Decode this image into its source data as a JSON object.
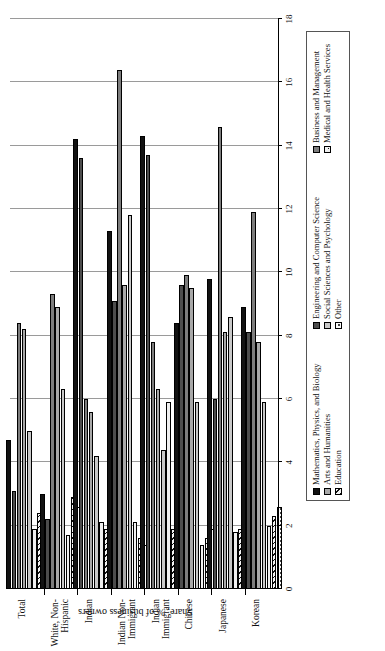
{
  "chart_data": {
    "type": "bar",
    "orientation": "horizontal",
    "title": "",
    "xlabel": "",
    "ylabel": "Share, % of business owners",
    "ylim": [
      0,
      18
    ],
    "ytick_step": 2,
    "yticks": [
      0,
      2,
      4,
      6,
      8,
      10,
      12,
      14,
      16,
      18
    ],
    "grid": true,
    "legend_position": "bottom",
    "categories": [
      "Total",
      "White, Non-Hispanic",
      "Indian",
      "Indian Non-Immigrant",
      "Indian Immigrant",
      "Chinese",
      "Japanese",
      "Korean"
    ],
    "series": [
      {
        "name": "Mathematics, Physics, and Biology",
        "values": [
          4.7,
          3.0,
          14.2,
          11.3,
          14.3,
          8.4,
          9.8,
          8.9
        ]
      },
      {
        "name": "Engineering and Computer Science",
        "values": [
          3.1,
          2.2,
          13.6,
          9.1,
          13.7,
          9.6,
          6.0,
          8.1
        ]
      },
      {
        "name": "Business and Management",
        "values": [
          8.4,
          9.3,
          6.0,
          16.4,
          7.8,
          9.9,
          14.6,
          11.9
        ]
      },
      {
        "name": "Arts and Humanities",
        "values": [
          8.2,
          8.9,
          5.6,
          9.6,
          6.3,
          9.5,
          8.1,
          7.8
        ]
      },
      {
        "name": "Social Sciences and Psychology",
        "values": [
          5.0,
          6.3,
          4.2,
          11.8,
          4.4,
          5.9,
          8.6,
          5.9
        ]
      },
      {
        "name": "Medical and Health Services",
        "values": [
          1.9,
          1.7,
          2.1,
          2.1,
          5.9,
          1.4,
          1.8,
          2.0
        ]
      },
      {
        "name": "Education",
        "values": [
          2.4,
          2.9,
          1.9,
          1.6,
          1.9,
          1.6,
          1.9,
          2.3
        ]
      },
      {
        "name": "Other",
        "values": [
          2.1,
          2.6,
          1.5,
          1.4,
          2.0,
          1.9,
          2.5,
          2.6
        ]
      }
    ]
  },
  "axis": {
    "value_axis_title": "Share, % of business owners",
    "tick_labels": [
      "0",
      "2",
      "4",
      "6",
      "8",
      "10",
      "12",
      "14",
      "16",
      "18"
    ]
  },
  "legend": {
    "items": [
      {
        "label": "Mathematics, Physics, and Biology",
        "swatch": "solid-black"
      },
      {
        "label": "Engineering and Computer Science",
        "swatch": "solid-dark-gray"
      },
      {
        "label": "Business and Management",
        "swatch": "solid-medium-gray"
      },
      {
        "label": "Arts and Humanities",
        "swatch": "solid-light-gray"
      },
      {
        "label": "Social Sciences and Psychology",
        "swatch": "solid-pale-gray"
      },
      {
        "label": "Medical and Health Services",
        "swatch": "dotted"
      },
      {
        "label": "Education",
        "swatch": "hatched"
      },
      {
        "label": "Other",
        "swatch": "fine-dotted"
      }
    ]
  },
  "colors": {
    "series_0": "#121212",
    "series_1": "#4d4d4d",
    "series_2": "#7d7d7d",
    "series_3": "#a8a8a8",
    "series_4": "#c8c8c8",
    "series_5": "#efefef",
    "series_6": "#f3f3f3",
    "series_7": "#fbfbfb",
    "gridline": "#9a9a9a",
    "axis": "#000000",
    "background": "#ffffff"
  }
}
